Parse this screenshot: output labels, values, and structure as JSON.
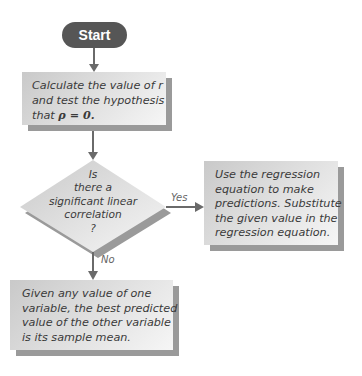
{
  "flowchart": {
    "start": {
      "label": "Start"
    },
    "step1": {
      "lines": [
        "Calculate the value of r",
        "and test the hypothesis",
        "that"
      ],
      "math": "ρ = 0."
    },
    "decision": {
      "lines": [
        "Is",
        "there a",
        "significant linear",
        "correlation",
        "?"
      ]
    },
    "yes_branch": {
      "label": "Yes",
      "lines": [
        "Use the regression",
        "equation to make",
        "predictions. Substitute",
        "the given value in the",
        "regression equation."
      ]
    },
    "no_branch": {
      "label": "No",
      "lines": [
        "Given any value of one",
        "variable, the best predicted",
        "value of the other variable",
        "is its sample mean."
      ]
    }
  },
  "colors": {
    "start_fill": "#565656",
    "arrow": "#6a6a6a",
    "box_fill_light": "#f6f6f6",
    "box_fill_dark": "#c9c9c9",
    "shadow": "#9a9a9a",
    "text": "#3a3a3a"
  }
}
